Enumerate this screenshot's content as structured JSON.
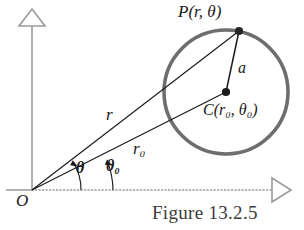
{
  "figure": {
    "caption": "Figure 13.2.5",
    "background": "#ffffff",
    "ink_color": "#1a1a1a",
    "circle_color": "#6e6e6e",
    "axis_color": "#9a9a9a"
  },
  "labels": {
    "point_p": {
      "name": "P",
      "args": "(r, θ)",
      "text": "P(r, θ)"
    },
    "center_c": {
      "name": "C",
      "args": "(r₀, θ₀)",
      "text": "C(r₀, θ₀)"
    },
    "radius_a": {
      "text": "a"
    },
    "segment_r": {
      "text": "r"
    },
    "segment_r0": {
      "text": "r₀"
    },
    "angle_theta": {
      "text": "θ"
    },
    "angle_theta0": {
      "text": "θ₀"
    },
    "origin": {
      "text": "O"
    }
  },
  "geometry": {
    "origin": {
      "x": 32,
      "y": 190
    },
    "circle_center": {
      "x": 226,
      "y": 92
    },
    "circle_radius": 62,
    "point_p": {
      "x": 240,
      "y": 31
    },
    "x_axis": {
      "x1": 32,
      "y1": 190,
      "x2": 292,
      "y2": 190,
      "style": "dotted",
      "arrow": "open-triangle-right"
    },
    "y_axis": {
      "x1": 32,
      "y1": 190,
      "x2": 32,
      "y2": 12,
      "style": "solid",
      "arrow": "open-triangle-up"
    },
    "angle_theta_degrees": 37.5,
    "angle_theta0_degrees": 26.7
  }
}
